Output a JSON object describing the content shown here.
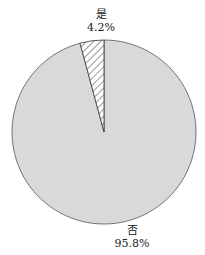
{
  "chart_data": {
    "type": "pie",
    "title": "",
    "categories": [
      "是",
      "否"
    ],
    "values": [
      4.2,
      95.8
    ],
    "labels": [
      {
        "name": "是",
        "percent_text": "4.2%"
      },
      {
        "name": "否",
        "percent_text": "95.8%"
      }
    ],
    "fills": [
      {
        "name": "是",
        "pattern": "diagonal-hatch",
        "color": "#ffffff",
        "line_color": "#333333"
      },
      {
        "name": "否",
        "pattern": "solid",
        "color": "#d9d9d9"
      }
    ],
    "start_angle": "12 o'clock",
    "direction": "counter-clockwise for 是",
    "legend": "none (labels placed outside slices)"
  },
  "labels": {
    "yes": {
      "name": "是",
      "percent": "4.2%"
    },
    "no": {
      "name": "否",
      "percent": "95.8%"
    }
  },
  "colors": {
    "no_fill": "#d9d9d9",
    "outline": "#555555",
    "hatch": "#333333"
  }
}
